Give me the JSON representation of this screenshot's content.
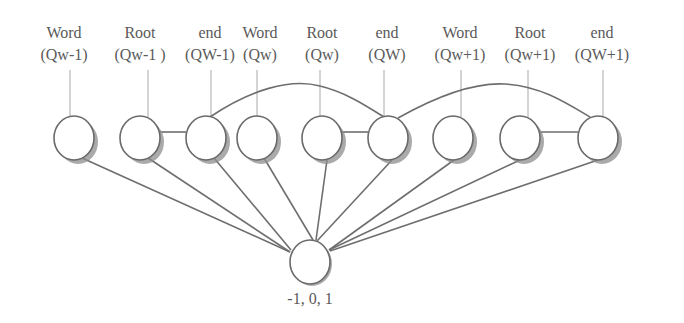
{
  "diagram": {
    "title": "",
    "top_nodes": [
      {
        "id": "n1",
        "line1": "Word",
        "line2": "(Qw-1)",
        "label_x": 64,
        "cx": 74,
        "guide_x": 70
      },
      {
        "id": "n2",
        "line1": "Root",
        "line2": "(Qw-1 )",
        "label_x": 140,
        "cx": 140,
        "guide_x": 148
      },
      {
        "id": "n3",
        "line1": "end",
        "line2": "(QW-1)",
        "label_x": 210,
        "cx": 206,
        "guide_x": 211
      },
      {
        "id": "n4",
        "line1": "Word",
        "line2": "(Qw)",
        "label_x": 260,
        "cx": 257,
        "guide_x": 257
      },
      {
        "id": "n5",
        "line1": "Root",
        "line2": "(Qw)",
        "label_x": 322,
        "cx": 322,
        "guide_x": 320
      },
      {
        "id": "n6",
        "line1": "end",
        "line2": "(QW)",
        "label_x": 387,
        "cx": 388,
        "guide_x": 384
      },
      {
        "id": "n7",
        "line1": "Word",
        "line2": "(Qw+1)",
        "label_x": 460,
        "cx": 453,
        "guide_x": 461
      },
      {
        "id": "n8",
        "line1": "Root",
        "line2": "(Qw+1)",
        "label_x": 530,
        "cx": 520,
        "guide_x": 528
      },
      {
        "id": "n9",
        "line1": "end",
        "line2": "(QW+1)",
        "label_x": 602,
        "cx": 598,
        "guide_x": 603
      }
    ],
    "top_row_cy": 138,
    "node_rx": 20,
    "node_ry": 22,
    "bottom_node": {
      "id": "out",
      "label": "-1, 0, 1",
      "cx": 310,
      "cy": 262,
      "rx": 20,
      "ry": 22
    },
    "horizontal_links": [
      [
        "n2",
        "n3"
      ],
      [
        "n5",
        "n6"
      ],
      [
        "n8",
        "n9"
      ]
    ],
    "arcs": [
      {
        "from": "n3",
        "to": "n6",
        "path": "M 210 117 C 250 90, 290 78, 320 86 C 345 92, 365 105, 384 117"
      },
      {
        "from": "n6",
        "to": "n9",
        "path": "M 398 118 C 430 100, 470 82, 505 84 C 540 86, 565 102, 590 117"
      }
    ],
    "edges_to_output": [
      {
        "from": "n1",
        "x1": 82,
        "y1": 158,
        "x2": 290,
        "y2": 252
      },
      {
        "from": "n2",
        "x1": 148,
        "y1": 158,
        "x2": 290,
        "y2": 252
      },
      {
        "from": "n3",
        "x1": 214,
        "y1": 158,
        "x2": 291,
        "y2": 250
      },
      {
        "from": "n4",
        "x1": 264,
        "y1": 158,
        "x2": 313,
        "y2": 240
      },
      {
        "from": "n5",
        "x1": 327,
        "y1": 160,
        "x2": 316,
        "y2": 240
      },
      {
        "from": "n6",
        "x1": 392,
        "y1": 160,
        "x2": 317,
        "y2": 241
      },
      {
        "from": "n7",
        "x1": 454,
        "y1": 160,
        "x2": 329,
        "y2": 250
      },
      {
        "from": "n8",
        "x1": 520,
        "y1": 160,
        "x2": 329,
        "y2": 250
      },
      {
        "from": "n9",
        "x1": 598,
        "y1": 160,
        "x2": 330,
        "y2": 251
      }
    ],
    "guide_y1": 70,
    "guide_y2": 117,
    "label_line1_y": 38,
    "label_line2_y": 60,
    "colors": {
      "text": "#5a5a5a",
      "edge": "#6e6e6e",
      "guide": "#a8a8a8",
      "shadow": "#8e8e8e"
    }
  }
}
